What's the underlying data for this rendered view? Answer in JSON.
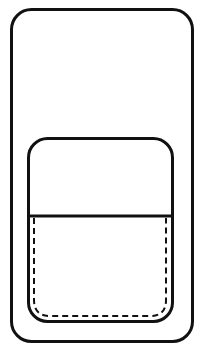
{
  "diagram": {
    "type": "line-drawing",
    "stroke_color": "#111111",
    "background": "#ffffff",
    "outer_body": {
      "x": 11,
      "y": 9,
      "width": 182,
      "height": 333,
      "radius": 20
    },
    "pocket": {
      "x": 28,
      "y": 138,
      "width": 145,
      "height": 184,
      "radius": 20
    },
    "pocket_divider": {
      "x1": 29,
      "y1": 216,
      "x2": 172,
      "y2": 216
    },
    "stitching": {
      "x": 33,
      "y": 218,
      "width": 134,
      "height": 98,
      "radius": 14,
      "dash": "6 4"
    }
  }
}
